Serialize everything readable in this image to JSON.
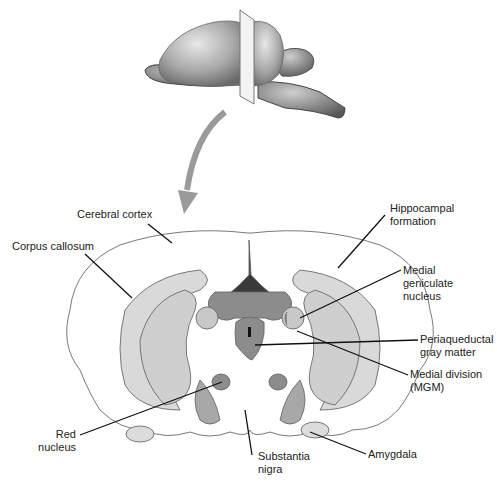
{
  "diagram": {
    "title_hint": "Coronal section of rat brain at level of medial geniculate",
    "colors": {
      "background": "#ffffff",
      "outline": "#6a6a6a",
      "light_gray": "#d6d6d6",
      "mid_gray": "#b5b5b5",
      "dark_gray": "#8c8c8c",
      "darkest": "#3a3a3a",
      "leader": "#111111",
      "arrow": "#9a9a9a"
    },
    "labels": {
      "cerebral_cortex": "Cerebral cortex",
      "corpus_callosum": "Corpus callosum",
      "hippocampal_formation": "Hippocampal\nformation",
      "medial_geniculate": "Medial\ngeniculate\nnucleus",
      "periaqueductal": "Periaqueductal\ngray matter",
      "medial_division": "Medial division\n(MGM)",
      "red_nucleus": "Red\nnucleus",
      "substantia_nigra": "Substantia\nnigra",
      "amygdala": "Amygdala"
    }
  }
}
